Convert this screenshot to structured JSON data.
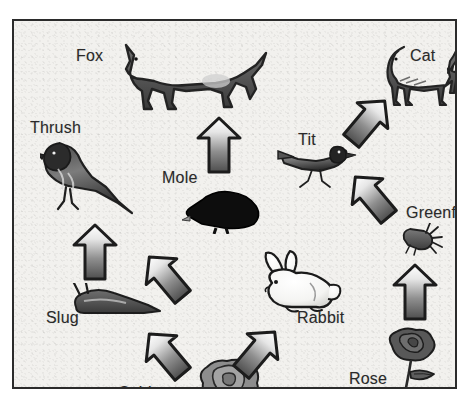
{
  "diagram": {
    "type": "food-web",
    "frame_color": "#2b2b2b",
    "paper_color": "#f2f1ee",
    "ink_color": "#2a2a2a",
    "organisms": [
      {
        "id": "fox",
        "label": "Fox",
        "icon": "fox-icon",
        "label_x": 62,
        "label_y": 26,
        "art_x": 110,
        "art_y": 18,
        "art_w": 146,
        "art_h": 72
      },
      {
        "id": "cat",
        "label": "Cat",
        "icon": "cat-icon",
        "label_x": 396,
        "label_y": 26,
        "art_x": 370,
        "art_y": 22,
        "art_w": 82,
        "art_h": 66
      },
      {
        "id": "thrush",
        "label": "Thrush",
        "icon": "thrush-icon",
        "label_x": 16,
        "label_y": 98,
        "art_x": 26,
        "art_y": 118,
        "art_w": 96,
        "art_h": 80
      },
      {
        "id": "tit",
        "label": "Tit",
        "icon": "tit-icon",
        "label_x": 284,
        "label_y": 110,
        "art_x": 262,
        "art_y": 120,
        "art_w": 82,
        "art_h": 52
      },
      {
        "id": "mole",
        "label": "Mole",
        "icon": "mole-icon",
        "label_x": 148,
        "label_y": 148,
        "art_x": 168,
        "art_y": 165,
        "art_w": 82,
        "art_h": 48
      },
      {
        "id": "greenfly",
        "label": "Greenfly",
        "icon": "greenfly-icon",
        "label_x": 392,
        "label_y": 183,
        "art_x": 386,
        "art_y": 202,
        "art_w": 44,
        "art_h": 34
      },
      {
        "id": "slug",
        "label": "Slug",
        "icon": "slug-icon",
        "label_x": 32,
        "label_y": 288,
        "art_x": 56,
        "art_y": 262,
        "art_w": 92,
        "art_h": 34
      },
      {
        "id": "rabbit",
        "label": "Rabbit",
        "icon": "rabbit-icon",
        "label_x": 283,
        "label_y": 288,
        "art_x": 238,
        "art_y": 228,
        "art_w": 92,
        "art_h": 68
      },
      {
        "id": "cabbage",
        "label": "Cabbage",
        "icon": "cabbage-icon",
        "label_x": 104,
        "label_y": 363,
        "art_x": 183,
        "art_y": 336,
        "art_w": 66,
        "art_h": 48
      },
      {
        "id": "rose",
        "label": "Rose",
        "icon": "rose-icon",
        "label_x": 335,
        "label_y": 349,
        "art_x": 370,
        "art_y": 305,
        "art_w": 58,
        "art_h": 82
      }
    ],
    "arrows": [
      {
        "id": "mole-to-fox",
        "from": "mole",
        "to": "fox",
        "rotation": 0,
        "x": 182,
        "y": 95,
        "w": 46,
        "h": 58
      },
      {
        "id": "slug-to-thrush",
        "from": "slug",
        "to": "thrush",
        "rotation": 0,
        "x": 58,
        "y": 202,
        "w": 46,
        "h": 58
      },
      {
        "id": "rose-to-greenfly",
        "from": "rose",
        "to": "greenfly",
        "rotation": 0,
        "x": 378,
        "y": 242,
        "w": 46,
        "h": 58
      },
      {
        "id": "tit-to-cat",
        "from": "tit",
        "to": "cat",
        "rotation": 40,
        "x": 332,
        "y": 72,
        "w": 44,
        "h": 56
      },
      {
        "id": "greenfly-to-tit",
        "from": "greenfly",
        "to": "tit",
        "rotation": -40,
        "x": 336,
        "y": 148,
        "w": 44,
        "h": 56
      },
      {
        "id": "cabbage-to-slug",
        "from": "cabbage",
        "to": "slug",
        "rotation": -40,
        "x": 130,
        "y": 228,
        "w": 44,
        "h": 56
      },
      {
        "id": "cabbage-to-slug-2",
        "from": "cabbage",
        "to": "slug",
        "rotation": -40,
        "x": 130,
        "y": 305,
        "w": 44,
        "h": 56
      },
      {
        "id": "cabbage-to-rabbit",
        "from": "cabbage",
        "to": "rabbit",
        "rotation": 40,
        "x": 222,
        "y": 303,
        "w": 44,
        "h": 56
      }
    ]
  }
}
